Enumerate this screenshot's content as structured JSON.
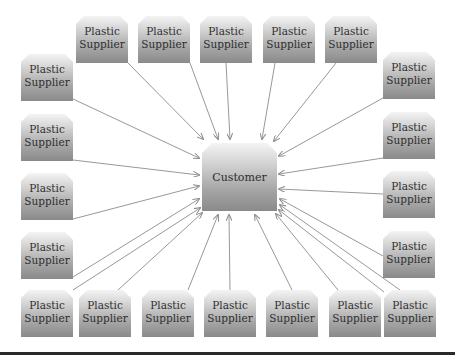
{
  "diagram": {
    "type": "hub-and-spoke",
    "center": {
      "label": "Customer"
    },
    "supplier_label_line1": "Plastic",
    "supplier_label_line2": "Supplier",
    "suppliers": [
      {
        "id": "t1",
        "line1": "Plastic",
        "line2": "Supplier"
      },
      {
        "id": "t2",
        "line1": "Plastic",
        "line2": "Supplier"
      },
      {
        "id": "t3",
        "line1": "Plastic",
        "line2": "Supplier"
      },
      {
        "id": "t4",
        "line1": "Plastic",
        "line2": "Supplier"
      },
      {
        "id": "t5",
        "line1": "Plastic",
        "line2": "Supplier"
      },
      {
        "id": "l1",
        "line1": "Plastic",
        "line2": "Supplier"
      },
      {
        "id": "l2",
        "line1": "Plastic",
        "line2": "Supplier"
      },
      {
        "id": "l3",
        "line1": "Plastic",
        "line2": "Supplier"
      },
      {
        "id": "l4",
        "line1": "Plastic",
        "line2": "Supplier"
      },
      {
        "id": "r1",
        "line1": "Plastic",
        "line2": "Supplier"
      },
      {
        "id": "r2",
        "line1": "Plastic",
        "line2": "Supplier"
      },
      {
        "id": "r3",
        "line1": "Plastic",
        "line2": "Supplier"
      },
      {
        "id": "r4",
        "line1": "Plastic",
        "line2": "Supplier"
      },
      {
        "id": "b1",
        "line1": "Plastic",
        "line2": "Supplier"
      },
      {
        "id": "b2",
        "line1": "Plastic",
        "line2": "Supplier"
      },
      {
        "id": "b3",
        "line1": "Plastic",
        "line2": "Supplier"
      },
      {
        "id": "b4",
        "line1": "Plastic",
        "line2": "Supplier"
      },
      {
        "id": "b5",
        "line1": "Plastic",
        "line2": "Supplier"
      },
      {
        "id": "b6",
        "line1": "Plastic",
        "line2": "Supplier"
      },
      {
        "id": "b7",
        "line1": "Plastic",
        "line2": "Supplier"
      }
    ],
    "supplier_count": 20,
    "edge_direction": "supplier-to-customer",
    "colors": {
      "box_top": "#f4f4f4",
      "box_bottom": "#8a8a8a",
      "text": "#2e2e2e",
      "arrow": "#8c8c8c",
      "rule": "#2a2a2a"
    }
  }
}
